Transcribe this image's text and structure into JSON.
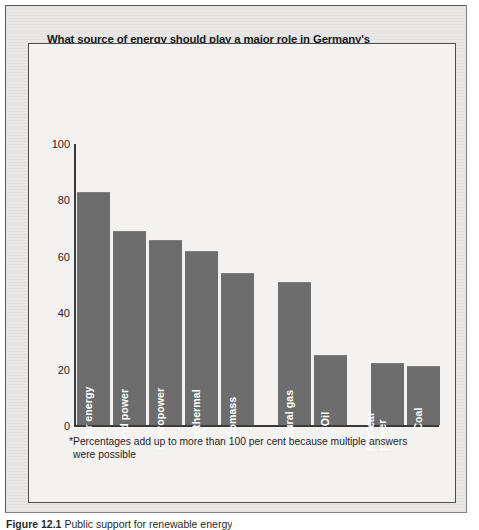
{
  "figure": {
    "caption_label": "Figure 12.1",
    "caption_text": "Public support for renewable energy"
  },
  "chart_data": {
    "type": "bar",
    "title": "What source of energy should play a major role in Germany's power supply over the next 20 to 30 years?",
    "subtitle": "Answers in per cent*",
    "xlabel": "",
    "ylabel": "",
    "ylim": [
      0,
      100
    ],
    "yticks": [
      100,
      80,
      60,
      40,
      20,
      0
    ],
    "grid": false,
    "legend": "none",
    "bar_color": "#6d6d6d",
    "categories": [
      "Solar energy",
      "Wind power",
      "Hydropower",
      "Geothermal",
      "Biomass",
      "Natural gas",
      "Oil",
      "Nuclear power",
      "Coal"
    ],
    "values": [
      83,
      69,
      66,
      62,
      54,
      51,
      25,
      22,
      21
    ],
    "groups": [
      {
        "name": "renewables",
        "categories": [
          "Solar energy",
          "Wind power",
          "Hydropower",
          "Geothermal",
          "Biomass"
        ]
      },
      {
        "name": "fossil-fuels",
        "categories": [
          "Natural gas",
          "Oil"
        ]
      },
      {
        "name": "nuclear-and-coal",
        "categories": [
          "Nuclear power",
          "Coal"
        ]
      }
    ],
    "annotations": [
      "*Percentages add up to more than 100 per cent because multiple answers were possible"
    ]
  },
  "footnote": {
    "line1": "*Percentages add up to more than 100 per cent because multiple answers",
    "line2": "were possible"
  }
}
